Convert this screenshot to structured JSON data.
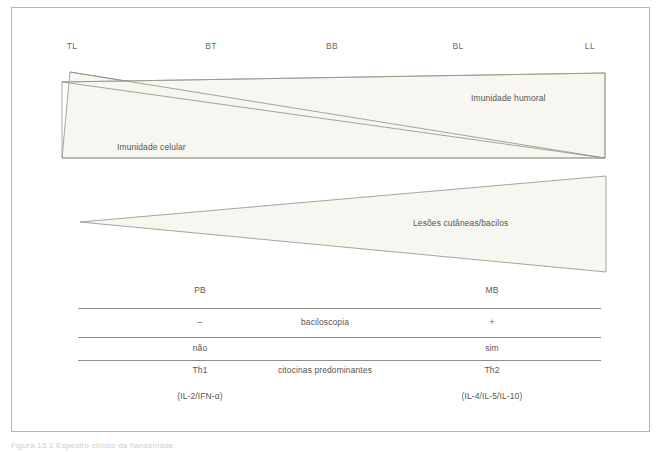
{
  "figure": {
    "spectrum_labels": [
      {
        "text": "TL",
        "x": 72
      },
      {
        "text": "BT",
        "x": 211
      },
      {
        "text": "BB",
        "x": 332
      },
      {
        "text": "BL",
        "x": 458
      },
      {
        "text": "LL",
        "x": 590
      }
    ],
    "band_labels": {
      "cellular": "Imunidade celular",
      "humoral": "Imunidade humoral",
      "lesions": "Lesões cutâneas/bacilos"
    },
    "caption": "Figura 15.1 Espectro clínico da hanseníase."
  },
  "table": {
    "headers": {
      "left": "PB",
      "middle": "",
      "right": "MB"
    },
    "rows": [
      {
        "left": "–",
        "middle": "baciloscopia",
        "right": "+"
      },
      {
        "left": "não",
        "middle": "",
        "right": "sim"
      },
      {
        "left": "Th1",
        "middle": "citocinas predominantes",
        "right": "Th2"
      },
      {
        "left": "(IL-2/IFN-α)",
        "middle": "",
        "right": "(IL-4/IL-5/IL-10)"
      }
    ]
  },
  "colors": {
    "frame": "#b9b6a9",
    "shape_fill": "#f7f6f0",
    "shape_stroke": "#8f8f80",
    "rule": "#8d8d82",
    "text": "#56564e"
  }
}
